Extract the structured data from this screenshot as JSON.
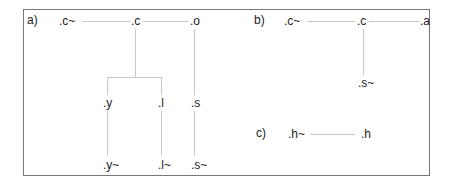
{
  "panels": [
    {
      "label": "a)",
      "nodes": {
        "c_tilde": ".c~",
        "c": ".c",
        "o": ".o",
        "y": ".y",
        "l": ".l",
        "s": ".s",
        "y_tilde": ".y~",
        "l_tilde": ".l~",
        "s_tilde": ".s~"
      },
      "edges": [
        [
          "c_tilde",
          "c"
        ],
        [
          "c",
          "o"
        ],
        [
          "c",
          "y"
        ],
        [
          "c",
          "l"
        ],
        [
          "o",
          "s"
        ],
        [
          "y",
          "y_tilde"
        ],
        [
          "l",
          "l_tilde"
        ],
        [
          "s",
          "s_tilde"
        ]
      ]
    },
    {
      "label": "b)",
      "nodes": {
        "c_tilde": ".c~",
        "c": ".c",
        "a": ".a",
        "s_tilde": ".s~"
      },
      "edges": [
        [
          "c_tilde",
          "c"
        ],
        [
          "c",
          "a"
        ],
        [
          "c",
          "s_tilde"
        ]
      ]
    },
    {
      "label": "c)",
      "nodes": {
        "h_tilde": ".h~",
        "h": ".h"
      },
      "edges": [
        [
          "h_tilde",
          "h"
        ]
      ]
    }
  ],
  "colors": {
    "border": "#777777",
    "edge": "#c8c8c8",
    "text": "#222222"
  }
}
